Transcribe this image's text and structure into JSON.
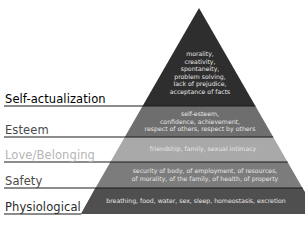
{
  "diagram": {
    "type": "pyramid",
    "levels": [
      {
        "label": "Self-actualization",
        "label_color": "#2a2a2a",
        "fill": "#2e2e2e",
        "lines": [
          "morality,",
          "creativity,",
          "spontaneity,",
          "problem solving,",
          "lack of prejudice,",
          "acceptance of facts"
        ]
      },
      {
        "label": "Esteem",
        "label_color": "#4a4a4a",
        "fill": "#6e6e6e",
        "lines": [
          "self-esteem,",
          "confidence, achievement,",
          "respect of others, respect by others"
        ]
      },
      {
        "label": "Love/Belonging",
        "label_color": "#b5b5b5",
        "fill": "#a9a9a9",
        "lines": [
          "friendship, family, sexual intimacy"
        ]
      },
      {
        "label": "Safety",
        "label_color": "#4a4a4a",
        "fill": "#7c7c7c",
        "lines": [
          "security of body, of employment, of resources,",
          "of morality, of the family, of health, of property"
        ]
      },
      {
        "label": "Physiological",
        "label_color": "#2a2a2a",
        "fill": "#4f4f4f",
        "lines": [
          "breathing, food, water, sex, sleep, homeostasis, excretion"
        ]
      }
    ]
  }
}
